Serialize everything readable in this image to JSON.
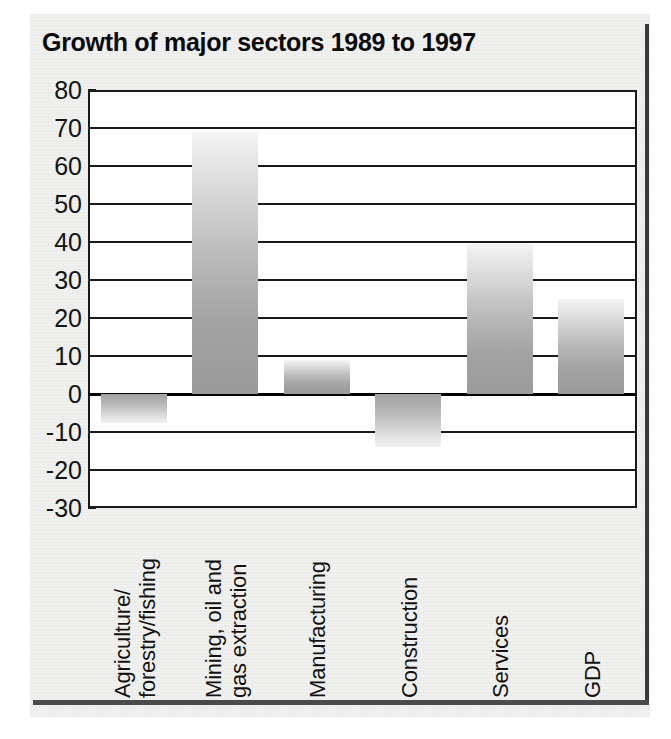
{
  "chart_data": {
    "type": "bar",
    "title": "Growth of major sectors 1989 to 1997",
    "xlabel": "",
    "ylabel": "",
    "ylim": [
      -30,
      80
    ],
    "yticks": [
      80,
      70,
      60,
      50,
      40,
      30,
      20,
      10,
      0,
      -10,
      -20,
      -30
    ],
    "ytick_labels": [
      "80",
      "70",
      "60",
      "50",
      "40",
      "30",
      "20",
      "10",
      "0",
      "-10",
      "-20",
      "-30"
    ],
    "grid": true,
    "legend": "none",
    "categories": [
      "Agriculture/ forestry/fishing",
      "Mining, oil and gas extraction",
      "Manufacturing",
      "Construction",
      "Services",
      "GDP"
    ],
    "category_lines": [
      [
        "Agriculture/",
        "forestry/fishing"
      ],
      [
        "Mining, oil and",
        "gas extraction"
      ],
      [
        "Manufacturing"
      ],
      [
        "Construction"
      ],
      [
        "Services"
      ],
      [
        "GDP"
      ]
    ],
    "values": [
      -7.5,
      69,
      9,
      -14,
      39.5,
      25
    ],
    "bar_fill": "#b0b0b0",
    "axis_color": "#1a1a1a",
    "title_color": "#0b0b0b"
  },
  "page": {
    "background": "#f1f1ef",
    "rule_color": "#4a4a4a"
  }
}
